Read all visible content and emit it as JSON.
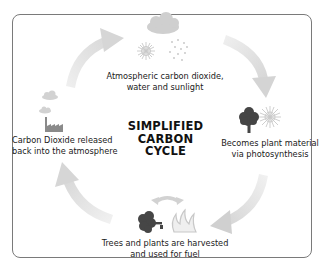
{
  "diagram": {
    "title_lines": [
      "SIMPLIFIED",
      "CARBON",
      "CYCLE"
    ],
    "stages": [
      {
        "id": "atmosphere",
        "lines": [
          "Atmospheric carbon dioxide,",
          "water and sunlight"
        ],
        "icons": [
          "cloud-icon",
          "sun-icon",
          "rain-icon"
        ]
      },
      {
        "id": "photosynthesis",
        "lines": [
          "Becomes plant material",
          "via photosynthesis"
        ],
        "icons": [
          "tree-icon",
          "sun-icon"
        ]
      },
      {
        "id": "harvest",
        "lines": [
          "Trees and plants are harvested",
          "and used for fuel"
        ],
        "icons": [
          "cut-tree-icon",
          "fire-icon",
          "exchange-arrow-icon"
        ]
      },
      {
        "id": "release",
        "lines": [
          "Carbon Dioxide released",
          "back into the atmosphere"
        ],
        "icons": [
          "factory-icon",
          "smoke-cloud-icon"
        ]
      }
    ],
    "colors": {
      "frame": "#7a7a7a",
      "arrow": "#e0e0e0",
      "icon_dark": "#444444",
      "icon_light": "#c8c8c8",
      "text": "#1a1a1a"
    }
  }
}
